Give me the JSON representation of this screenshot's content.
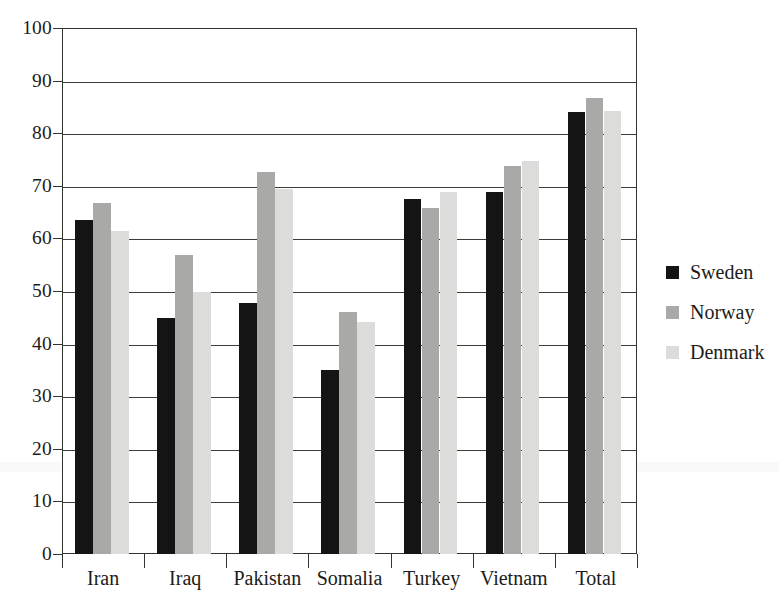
{
  "chart_data": {
    "type": "bar",
    "title": "",
    "subtitle": "",
    "xlabel": "",
    "ylabel": "",
    "categories": [
      "Iran",
      "Iraq",
      "Pakistan",
      "Somalia",
      "Turkey",
      "Vietnam",
      "Total"
    ],
    "series": [
      {
        "name": "Sweden",
        "color": "#141414",
        "values": [
          63.5,
          44.8,
          47.8,
          35.0,
          67.5,
          68.9,
          84.0
        ]
      },
      {
        "name": "Norway",
        "color": "#a9a9a7",
        "values": [
          66.8,
          56.9,
          72.6,
          46.1,
          65.8,
          73.8,
          86.7
        ]
      },
      {
        "name": "Denmark",
        "color": "#dcdcda",
        "values": [
          61.5,
          49.8,
          69.3,
          44.1,
          68.9,
          74.8,
          84.3
        ]
      }
    ],
    "ylim": [
      0,
      100
    ],
    "y_ticks": [
      0,
      10,
      20,
      30,
      40,
      50,
      60,
      70,
      80,
      90,
      100
    ],
    "y_tick_labels": [
      "0",
      "10",
      "20",
      "30",
      "40",
      "50",
      "60",
      "70",
      "80",
      "90",
      "100"
    ],
    "grid": true,
    "grid_axis": "y",
    "legend_position": "right",
    "legend_entries": [
      "Sweden",
      "Norway",
      "Denmark"
    ],
    "annotations": []
  },
  "legend": {
    "items": [
      {
        "label": "Sweden",
        "swatch": "legend-swatch-sweden"
      },
      {
        "label": "Norway",
        "swatch": "legend-swatch-norway"
      },
      {
        "label": "Denmark",
        "swatch": "legend-swatch-denmark"
      }
    ]
  },
  "colors": {
    "sweden": "#141414",
    "norway": "#a9a9a7",
    "denmark": "#dcdcda",
    "axis": "#33332f",
    "background": "#ffffff"
  }
}
